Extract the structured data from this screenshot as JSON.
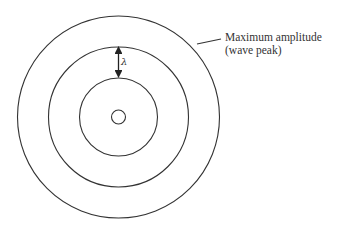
{
  "diagram": {
    "type": "concentric-wavefronts",
    "center": {
      "x": 118.5,
      "y": 117
    },
    "rings": [
      {
        "name": "source",
        "r": 7
      },
      {
        "name": "ring-1",
        "r": 39
      },
      {
        "name": "ring-2",
        "r": 70
      },
      {
        "name": "ring-3",
        "r": 101
      }
    ],
    "stroke_color": "#333333",
    "wavelength_symbol": "λ",
    "annotation": {
      "line1": "Maximum amplitude",
      "line2": "(wave peak)"
    }
  }
}
